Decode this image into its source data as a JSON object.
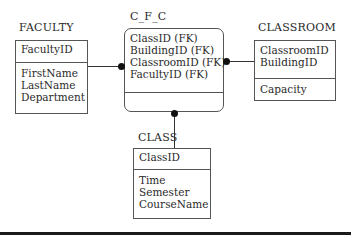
{
  "diagram": {
    "type": "entity-relationship",
    "entities": {
      "faculty": {
        "name": "FACULTY",
        "keys": [
          "FacultyID"
        ],
        "attributes": [
          "FirstName",
          "LastName",
          "Department"
        ]
      },
      "cfc": {
        "name": "C_F_C",
        "keys": [
          "ClassID (FK)",
          "BuildingID (FK)",
          "ClassroomID (FK)",
          "FacultyID (FK)"
        ],
        "attributes": []
      },
      "classroom": {
        "name": "CLASSROOM",
        "keys": [
          "ClassroomID",
          "BuildingID"
        ],
        "attributes": [
          "Capacity"
        ]
      },
      "class": {
        "name": "CLASS",
        "keys": [
          "ClassID"
        ],
        "attributes": [
          "Time",
          "Semester",
          "CourseName"
        ]
      }
    },
    "relationships": [
      {
        "from": "FACULTY",
        "to": "C_F_C",
        "end": "many-dot-at-C_F_C"
      },
      {
        "from": "CLASSROOM",
        "to": "C_F_C",
        "end": "many-dot-at-C_F_C"
      },
      {
        "from": "CLASS",
        "to": "C_F_C",
        "end": "many-dot-at-C_F_C"
      }
    ]
  }
}
